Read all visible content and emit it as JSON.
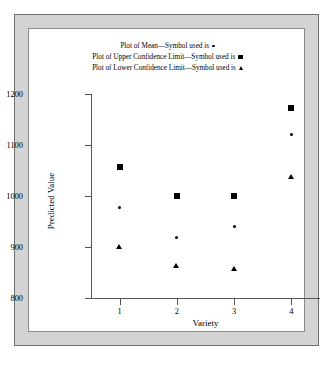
{
  "legend": {
    "entries": [
      {
        "text": "Plot of Mean—Symbol used is",
        "symbol": "dot-symbol"
      },
      {
        "text": "Plot of Upper Confidence Limit—Symbol used is",
        "symbol": "square-symbol"
      },
      {
        "text": "Plot of Lower Confidence Limit—Symbol used is",
        "symbol": "triangle-symbol"
      }
    ]
  },
  "axes": {
    "ylabel": "Predicted Value",
    "xlabel": "Variety",
    "yticks": [
      "800",
      "900",
      "1000",
      "1100",
      "1200"
    ],
    "xticks": [
      "1",
      "2",
      "3",
      "4"
    ]
  },
  "chart_data": {
    "type": "scatter",
    "title": "",
    "xlabel": "Variety",
    "ylabel": "Predicted Value",
    "xlim": [
      0.5,
      4.5
    ],
    "ylim": [
      780,
      1210
    ],
    "ytick_values": [
      800,
      900,
      1000,
      1100,
      1200
    ],
    "xtick_values": [
      1,
      2,
      3,
      4
    ],
    "grid": false,
    "legend_position": "top-center",
    "categories": [
      "1",
      "2",
      "3",
      "4"
    ],
    "series": [
      {
        "name": "Mean",
        "symbol": "dot",
        "legend_label": "Plot of Mean—Symbol used is",
        "values": [
          977,
          918,
          940,
          1121
        ]
      },
      {
        "name": "Upper Confidence Limit",
        "symbol": "square",
        "legend_label": "Plot of Upper Confidence Limit—Symbol used is",
        "values": [
          1057,
          1000,
          1000,
          1173
        ]
      },
      {
        "name": "Lower Confidence Limit",
        "symbol": "triangle",
        "legend_label": "Plot of Lower Confidence Limit—Symbol used is",
        "values": [
          899,
          861,
          856,
          1037
        ]
      }
    ]
  }
}
